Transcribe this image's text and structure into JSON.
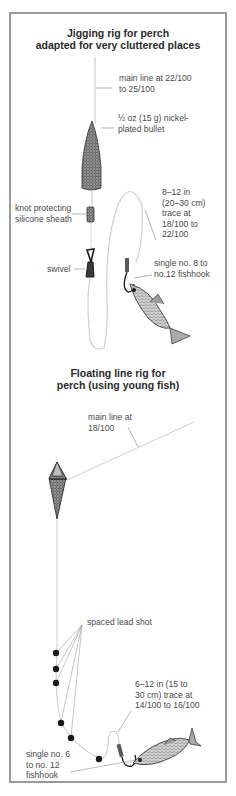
{
  "colors": {
    "frame": "#9a9a9a",
    "line": "#c8c8c8",
    "leader": "#a0a0a0",
    "lead": "#1a1a1a",
    "text": "#4a4a4a",
    "title": "#2a2a2a"
  },
  "rig1": {
    "title_line1": "Jigging rig for perch",
    "title_line2": "adapted for very cluttered places",
    "labels": {
      "main_line": "main line at 22/100\nto 25/100",
      "bullet": "½ oz (15 g) nickel-\nplated bullet",
      "sheath": "knot protecting\nsilicone sheath",
      "swivel": "swivel",
      "trace": "8–12 in\n(20–30 cm)\ntrace at\n18/100 to\n22/100",
      "hook": "single no. 8 to\nno.12 fishhook"
    },
    "icons": [
      "bullet-weight-icon",
      "silicone-sheath-icon",
      "swivel-icon",
      "fishhook-icon",
      "bait-fish-icon"
    ]
  },
  "rig2": {
    "title_line1": "Floating line rig for",
    "title_line2": "perch (using young fish)",
    "labels": {
      "main_line": "main line at\n18/100",
      "lead_shot": "spaced lead shot",
      "trace": "6–12 in (15 to\n30 cm) trace at\n14/100 to 16/100",
      "hook": "single no. 6\nto no. 12\nfishhook"
    },
    "icons": [
      "float-icon",
      "lead-shot-icon",
      "fishhook-icon",
      "bait-fish-icon"
    ]
  }
}
